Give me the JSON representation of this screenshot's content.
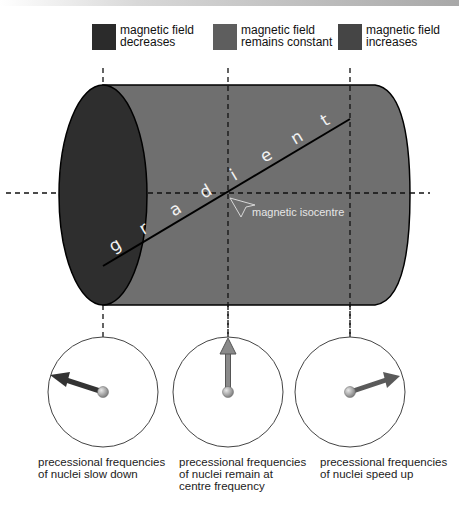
{
  "legend": [
    {
      "label": "magnetic field\ndecreases",
      "color": "#2b2b2b"
    },
    {
      "label": "magnetic field\nremains constant",
      "color": "#5e5e5e"
    },
    {
      "label": "magnetic field\nincreases",
      "color": "#454545"
    }
  ],
  "cylinder": {
    "gradient_label": "gradient",
    "gradient_letters": [
      "g",
      "r",
      "a",
      "d",
      "i",
      "e",
      "n",
      "t"
    ],
    "isocentre_label": "magnetic isocentre",
    "colors": {
      "body": "#6f6f6f",
      "end_face": "#2e2e2e"
    }
  },
  "clocks": [
    {
      "caption": "precessional frequencies\nof nuclei slow down",
      "arrow_color": "#333333",
      "direction": "counter-clockwise from top"
    },
    {
      "caption": "precessional frequencies\nof nuclei remain at\ncentre frequency",
      "arrow_color": "#7a7a7a",
      "direction": "top"
    },
    {
      "caption": "precessional frequencies\nof nuclei speed up",
      "arrow_color": "#5a5a5a",
      "direction": "clockwise from top"
    }
  ]
}
